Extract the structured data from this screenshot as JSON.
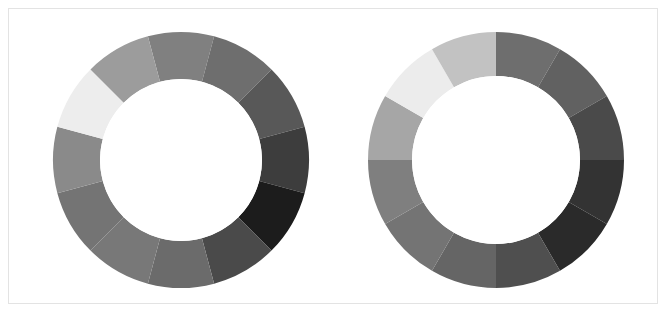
{
  "figure": {
    "width": 668,
    "height": 314,
    "background_color": "#ffffff",
    "border_color": "#e3e3e3",
    "border_inset": 8
  },
  "chart_data": [
    {
      "type": "pie",
      "name": "left-donut",
      "title": "",
      "subtitle": "",
      "xlabel": "",
      "ylabel": "",
      "legend_position": "none",
      "grid": false,
      "donut": true,
      "center_x": 181,
      "center_y": 160,
      "outer_radius": 128,
      "inner_radius": 81,
      "start_angle_deg": -105,
      "direction": "clockwise",
      "categories": [
        "s1",
        "s2",
        "s3",
        "s4",
        "s5",
        "s6",
        "s7",
        "s8",
        "s9",
        "s10",
        "s11",
        "s12"
      ],
      "values": [
        30,
        30,
        30,
        30,
        30,
        30,
        30,
        30,
        30,
        30,
        30,
        30
      ],
      "colors": [
        "#808080",
        "#6e6e6e",
        "#585858",
        "#3d3d3d",
        "#1c1c1c",
        "#4a4a4a",
        "#6b6b6b",
        "#787878",
        "#747474",
        "#8a8a8a",
        "#ededed",
        "#9c9c9c"
      ]
    },
    {
      "type": "pie",
      "name": "right-donut",
      "title": "",
      "subtitle": "",
      "xlabel": "",
      "ylabel": "",
      "legend_position": "none",
      "grid": false,
      "donut": true,
      "center_x": 496,
      "center_y": 160,
      "outer_radius": 128,
      "inner_radius": 84,
      "start_angle_deg": -90,
      "direction": "clockwise",
      "categories": [
        "s1",
        "s2",
        "s3",
        "s4",
        "s5",
        "s6",
        "s7",
        "s8",
        "s9",
        "s10",
        "s11",
        "s12"
      ],
      "values": [
        30,
        30,
        30,
        30,
        30,
        30,
        30,
        30,
        30,
        30,
        30,
        30
      ],
      "colors": [
        "#6e6e6e",
        "#616161",
        "#4a4a4a",
        "#333333",
        "#2a2a2a",
        "#4f4f4f",
        "#656565",
        "#747474",
        "#7f7f7f",
        "#a6a6a6",
        "#ececec",
        "#c2c2c2"
      ]
    }
  ]
}
